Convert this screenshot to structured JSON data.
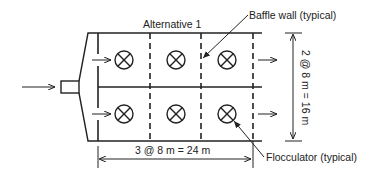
{
  "title": "Alternative 1",
  "callouts": {
    "baffle": "Baffle wall (typical)",
    "flocculator": "Flocculator (typical)"
  },
  "dimensions": {
    "horizontal": "3 @ 8 m = 24 m",
    "vertical": "2 @ 8 m = 16 m"
  },
  "layout": {
    "rows": 2,
    "columns": 3,
    "cell_size_m": 8,
    "total_length_m": 24,
    "total_width_m": 16
  },
  "icons": {
    "flocculator": "circle-x-icon",
    "flow": "arrow-right-icon"
  },
  "colors": {
    "line": "#222222",
    "background": "#ffffff"
  }
}
